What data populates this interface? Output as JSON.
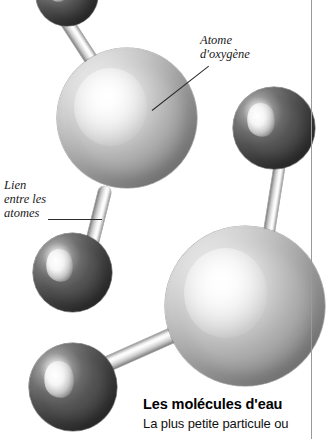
{
  "figure": {
    "title": "Les molécules d'eau",
    "background_color": "#ffffff",
    "width": 328,
    "height": 439
  },
  "callouts": [
    {
      "id": "oxygen-atom",
      "text": "Atome\nd'oxygène",
      "x": 200,
      "y": 33,
      "leader": {
        "x": 152,
        "y": 110,
        "length": 72,
        "angle": -38
      }
    },
    {
      "id": "atom-bond",
      "text": "Lien\nentre les\natomes",
      "x": 4,
      "y": 178,
      "leader": {
        "x": 48,
        "y": 219,
        "length": 54,
        "angle": 0
      }
    }
  ],
  "atoms": [
    {
      "id": "hydrogen-top-left",
      "kind": "hydrogen",
      "label": "hydrogen-atom",
      "x": 36,
      "y": -36,
      "size": 62,
      "color": "#444444"
    },
    {
      "id": "oxygen-center-left",
      "kind": "oxygen",
      "label": "oxygen-atom",
      "x": 57,
      "y": 48,
      "size": 140,
      "color": "#b5b5b5"
    },
    {
      "id": "hydrogen-right-upper",
      "kind": "hydrogen",
      "label": "hydrogen-atom",
      "x": 233,
      "y": 87,
      "size": 82,
      "color": "#444444"
    },
    {
      "id": "hydrogen-mid-left",
      "kind": "hydrogen",
      "label": "hydrogen-atom",
      "x": 33,
      "y": 233,
      "size": 79,
      "color": "#444444"
    },
    {
      "id": "oxygen-bottom-right",
      "kind": "oxygen",
      "label": "oxygen-atom",
      "x": 165,
      "y": 226,
      "size": 160,
      "color": "#b5b5b5"
    },
    {
      "id": "hydrogen-bottom-left",
      "kind": "hydrogen",
      "label": "hydrogen-atom",
      "x": 29,
      "y": 343,
      "size": 88,
      "color": "#444444"
    }
  ],
  "bonds": [
    {
      "id": "bond-top-left",
      "label": "atom-bond",
      "x": 62,
      "y": 14,
      "length": 80,
      "thickness": 13,
      "angle": 57
    },
    {
      "id": "bond-oxygen-to-hydrogen-mid",
      "label": "atom-bond",
      "x": 106,
      "y": 186,
      "length": 72,
      "thickness": 13,
      "angle": 104
    },
    {
      "id": "bond-right-vertical",
      "label": "atom-bond",
      "x": 281,
      "y": 156,
      "length": 86,
      "thickness": 11,
      "angle": 99
    },
    {
      "id": "bond-bottom-left",
      "label": "atom-bond",
      "x": 102,
      "y": 366,
      "length": 88,
      "thickness": 15,
      "angle": -24
    }
  ],
  "column_rule": {
    "label": "column-divider",
    "x": 311,
    "color": "#9a9a9a"
  },
  "caption": {
    "title": "Les molécules d'eau",
    "body": "La plus petite particule ou"
  }
}
